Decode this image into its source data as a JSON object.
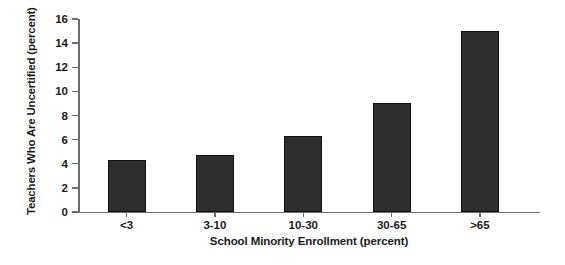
{
  "chart_data": {
    "type": "bar",
    "title": "",
    "categories": [
      "<3",
      "3-10",
      "10-30",
      "30-65",
      ">65"
    ],
    "values": [
      4.3,
      4.7,
      6.3,
      9.0,
      15.0
    ],
    "series": [
      {
        "name": "Teachers Who Are Uncertified",
        "values": [
          4.3,
          4.7,
          6.3,
          9.0,
          15.0
        ]
      }
    ],
    "xlabel": "School Minority Enrollment (percent)",
    "ylabel": "Teachers Who Are Uncertified (percent)",
    "ylim": [
      0,
      16
    ],
    "yticks": [
      0,
      2,
      4,
      6,
      8,
      10,
      12,
      14,
      16
    ],
    "ytick_labels": [
      "0",
      "2",
      "4",
      "6",
      "8",
      "10",
      "12",
      "14",
      "16"
    ],
    "grid": false,
    "legend": false,
    "bar_color": "#2e2e2e",
    "axis_color": "#6e6e6e",
    "background": "#ffffff"
  }
}
